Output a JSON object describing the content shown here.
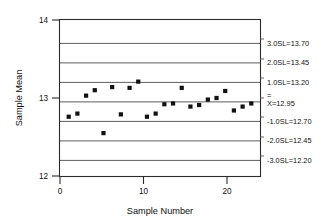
{
  "chart_data": {
    "type": "scatter",
    "title": "",
    "xlabel": "Sample Number",
    "ylabel": "Sample Mean",
    "xlim": [
      0,
      23
    ],
    "ylim": [
      12,
      14
    ],
    "xticks": [
      "0",
      "10",
      "20"
    ],
    "xtick_values": [
      0,
      10,
      20
    ],
    "yticks": [
      "12",
      "13",
      "14"
    ],
    "ytick_values": [
      12,
      13,
      14
    ],
    "grid": false,
    "legend": "none",
    "x": [
      1,
      2,
      3,
      4,
      5,
      6,
      7,
      8,
      9,
      10,
      11,
      12,
      13,
      14,
      15,
      16,
      17,
      18,
      19,
      20,
      21,
      22
    ],
    "values": [
      12.76,
      12.8,
      13.03,
      13.1,
      12.55,
      13.14,
      12.79,
      13.13,
      13.21,
      12.76,
      12.8,
      12.92,
      12.93,
      13.13,
      12.89,
      12.91,
      12.98,
      13.0,
      13.09,
      12.84,
      12.89,
      12.93
    ],
    "series": [
      {
        "name": "Sample Mean",
        "values": [
          12.76,
          12.8,
          13.03,
          13.1,
          12.55,
          13.14,
          12.79,
          13.13,
          13.21,
          12.76,
          12.8,
          12.92,
          12.93,
          13.13,
          12.89,
          12.91,
          12.98,
          13.0,
          13.09,
          12.84,
          12.89,
          12.93
        ]
      }
    ],
    "control_limits": [
      {
        "name": "3.0SL",
        "label": "3.0SL=13.70",
        "value": 13.7
      },
      {
        "name": "2.0SL",
        "label": "2.0SL=13.45",
        "value": 13.45
      },
      {
        "name": "1.0SL",
        "label": "1.0SL=13.20",
        "value": 13.2
      },
      {
        "name": "center",
        "label": "X=12.95",
        "value": 12.95,
        "bar": "="
      },
      {
        "name": "-1.0SL",
        "label": "-1.0SL=12.70",
        "value": 12.7
      },
      {
        "name": "-2.0SL",
        "label": "-2.0SL=12.45",
        "value": 12.45
      },
      {
        "name": "-3.0SL",
        "label": "-3.0SL=12.20",
        "value": 12.2
      }
    ]
  },
  "axes": {
    "y_title": "Sample Mean",
    "x_title": "Sample Number",
    "y_tick_labels": [
      "14",
      "13",
      "12"
    ],
    "x_tick_labels": [
      "0",
      "10",
      "20"
    ]
  },
  "limit_labels": {
    "sl3_upper": "3.0SL=13.70",
    "sl2_upper": "2.0SL=13.45",
    "sl1_upper": "1.0SL=13.20",
    "center_bar": "=",
    "center": "X=12.95",
    "sl1_lower": "-1.0SL=12.70",
    "sl2_lower": "-2.0SL=12.45",
    "sl3_lower": "-3.0SL=12.20"
  },
  "colors": {
    "axis": "#2b2b2b",
    "limit_line": "#5d5d5d",
    "marker": "#111111",
    "background": "#ffffff"
  }
}
